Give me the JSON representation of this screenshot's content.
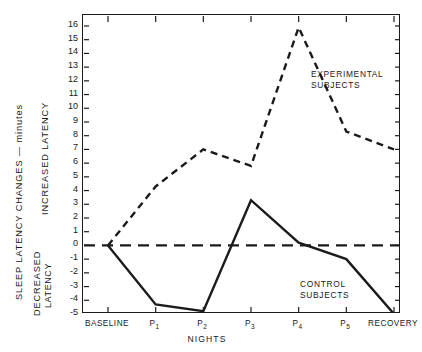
{
  "axes": {
    "y_title_main": "SLEEP LATENCY CHANGES — minutes",
    "y_title_increased": "INCREASED LATENCY",
    "y_title_decreased_line1": "DECREASED",
    "y_title_decreased_line2": "LATENCY",
    "x_title": "NIGHTS"
  },
  "annotations": {
    "experimental_line1": "EXPERIMENTAL",
    "experimental_line2": "SUBJECTS",
    "control_line1": "CONTROL",
    "control_line2": "SUBJECTS"
  },
  "chart_data": {
    "type": "line",
    "title": "",
    "subtitle": "",
    "xlabel": "NIGHTS",
    "ylabel": "SLEEP LATENCY CHANGES — minutes",
    "categories": [
      "BASELINE",
      "P1",
      "P2",
      "P3",
      "P4",
      "P5",
      "RECOVERY"
    ],
    "x_tick_labels": [
      "BASELINE",
      "P₁",
      "P₂",
      "P₃",
      "P₄",
      "P₅",
      "RECOVERY"
    ],
    "y_tick_labels": [
      "16",
      "15",
      "14",
      "13",
      "12",
      "11",
      "10",
      "9",
      "8",
      "7",
      "6",
      "5",
      "4",
      "3",
      "2",
      "1",
      "0",
      "-1",
      "-2",
      "-3",
      "-4",
      "-5"
    ],
    "y_tick_values": [
      16,
      15,
      14,
      13,
      12,
      11,
      10,
      9,
      8,
      7,
      6,
      5,
      4,
      3,
      2,
      1,
      0,
      -1,
      -2,
      -3,
      -4,
      -5
    ],
    "ylim": [
      -5,
      16.8
    ],
    "grid": false,
    "legend_position": "inline-annotations",
    "zero_reference_line": {
      "value": 0,
      "style": "dashed",
      "color": "#1b1b1b"
    },
    "series": [
      {
        "name": "EXPERIMENTAL SUBJECTS",
        "style": "dashed",
        "color": "#1b1b1b",
        "values": [
          0,
          4.3,
          7.0,
          5.8,
          15.9,
          8.3,
          7.0
        ]
      },
      {
        "name": "CONTROL SUBJECTS",
        "style": "solid",
        "color": "#1b1b1b",
        "values": [
          0,
          -4.3,
          -4.8,
          3.3,
          0.2,
          -1.0,
          -5.0
        ]
      }
    ]
  },
  "colors": {
    "ink": "#1b1b1b",
    "background": "#ffffff"
  }
}
